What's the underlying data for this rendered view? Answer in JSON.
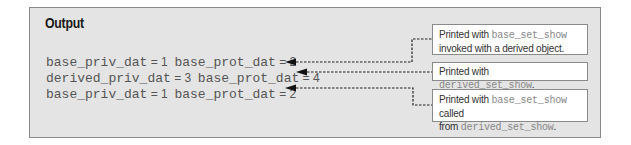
{
  "title": "Output",
  "output_lines": [
    {
      "a_name": "base_priv_dat",
      "a_eq": " = 1  ",
      "b_name": "base_prot_dat",
      "b_eq": " = 2"
    },
    {
      "a_name": "derived_priv_dat",
      "a_eq": " = 3  ",
      "b_name": "base_prot_dat",
      "b_eq": " = 4"
    },
    {
      "a_name": "base_priv_dat",
      "a_eq": " = 1  ",
      "b_name": "base_prot_dat",
      "b_eq": " = 2"
    }
  ],
  "callouts": [
    {
      "prefix": "Printed with ",
      "code1": "base_set_show",
      "middle": "",
      "code2": "",
      "suffix": "invoked with a derived object."
    },
    {
      "prefix": "Printed with ",
      "code1": "derived_set_show",
      "middle": "",
      "code2": "",
      "suffix": "."
    },
    {
      "prefix": "Printed with ",
      "code1": "base_set_show",
      "middle": " called",
      "line2_prefix": "from ",
      "code2": "derived_set_show",
      "suffix": "."
    }
  ],
  "colors": {
    "panel_bg": "#e4e4e4",
    "border": "#8a8a8a",
    "text": "#555555",
    "connector": "#222222"
  }
}
